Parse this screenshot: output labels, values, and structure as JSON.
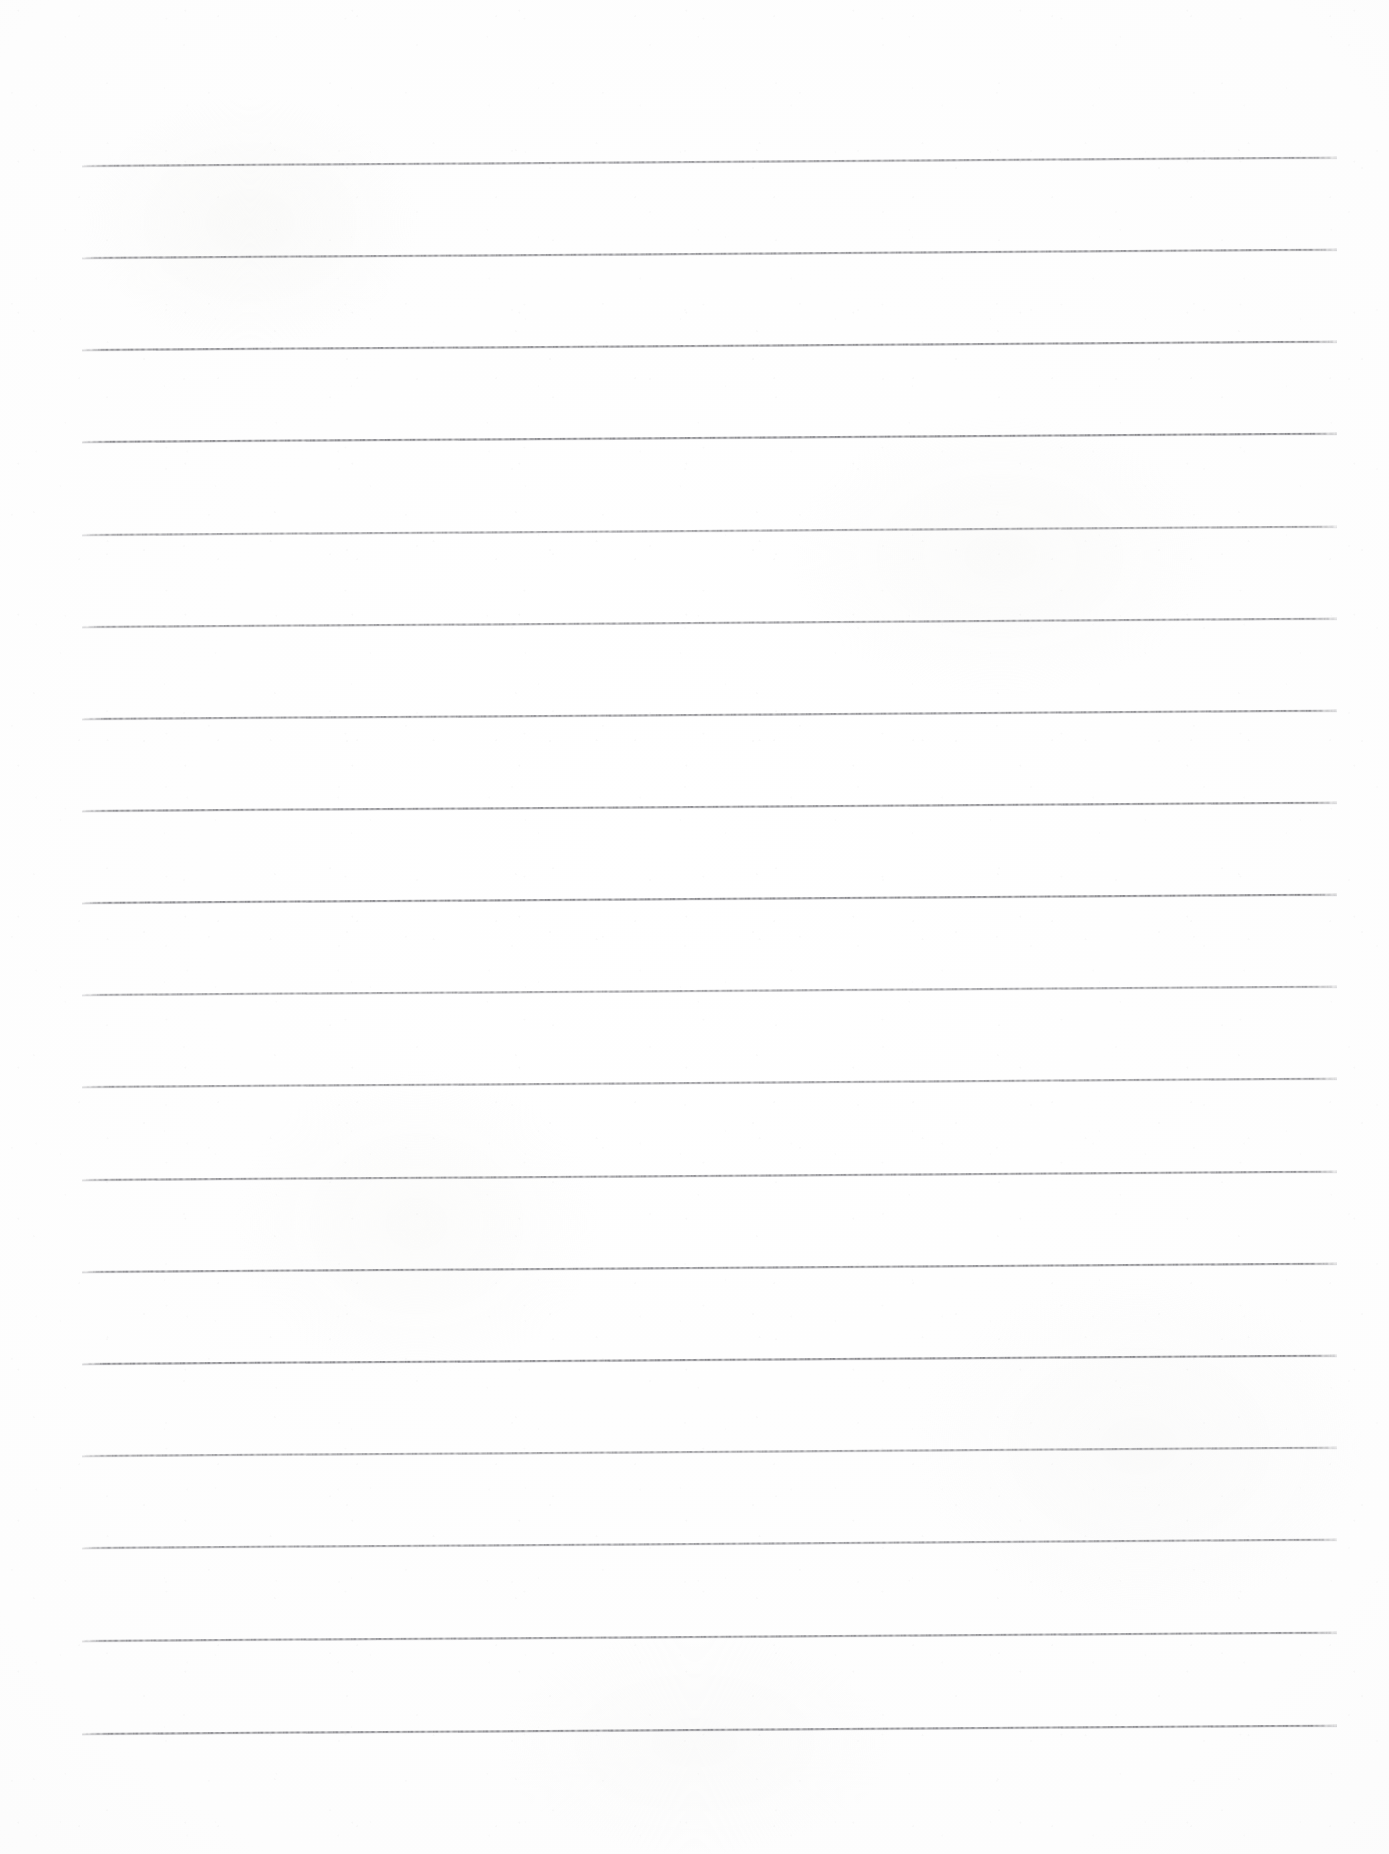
{
  "document": {
    "kind": "scanned-lined-paper",
    "title": "Blank Ruled Notebook Sheet",
    "page_width": 1389,
    "page_height": 1854,
    "paper_color": "#fefefe",
    "rule_color": "#84848a",
    "text_content": "",
    "has_text": false,
    "has_header": false,
    "has_margin_rule": false,
    "has_hole_punches": false
  },
  "ruling": {
    "line_count": 18,
    "first_line_y": 165,
    "line_spacing": 92.2,
    "last_line_y": 1733,
    "left_x": 82,
    "right_x": 1337,
    "line_length": 1255,
    "thickness_px": 1.6,
    "skew_degrees": -0.38,
    "margin_top": 165,
    "margin_bottom": 121,
    "margin_left": 82,
    "margin_right": 52,
    "lines": [
      {
        "index": 1,
        "y": 165,
        "x1": 82,
        "x2": 1337
      },
      {
        "index": 2,
        "y": 257,
        "x1": 82,
        "x2": 1337
      },
      {
        "index": 3,
        "y": 349,
        "x1": 82,
        "x2": 1337
      },
      {
        "index": 4,
        "y": 441,
        "x1": 82,
        "x2": 1337
      },
      {
        "index": 5,
        "y": 534,
        "x1": 82,
        "x2": 1337
      },
      {
        "index": 6,
        "y": 626,
        "x1": 82,
        "x2": 1337
      },
      {
        "index": 7,
        "y": 718,
        "x1": 82,
        "x2": 1337
      },
      {
        "index": 8,
        "y": 810,
        "x1": 82,
        "x2": 1337
      },
      {
        "index": 9,
        "y": 902,
        "x1": 82,
        "x2": 1337
      },
      {
        "index": 10,
        "y": 994,
        "x1": 82,
        "x2": 1337
      },
      {
        "index": 11,
        "y": 1086,
        "x1": 82,
        "x2": 1337
      },
      {
        "index": 12,
        "y": 1179,
        "x1": 82,
        "x2": 1337
      },
      {
        "index": 13,
        "y": 1271,
        "x1": 82,
        "x2": 1337
      },
      {
        "index": 14,
        "y": 1363,
        "x1": 82,
        "x2": 1337
      },
      {
        "index": 15,
        "y": 1455,
        "x1": 82,
        "x2": 1337
      },
      {
        "index": 16,
        "y": 1547,
        "x1": 82,
        "x2": 1337
      },
      {
        "index": 17,
        "y": 1640,
        "x1": 82,
        "x2": 1337
      },
      {
        "index": 18,
        "y": 1733,
        "x1": 82,
        "x2": 1337
      }
    ]
  }
}
